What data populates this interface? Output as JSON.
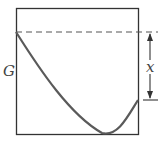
{
  "diagram": {
    "y_label": "G",
    "bracket_label": "x",
    "colors": {
      "curve": "#5a5a5a",
      "frame": "#333333",
      "dashed": "#555555"
    }
  }
}
